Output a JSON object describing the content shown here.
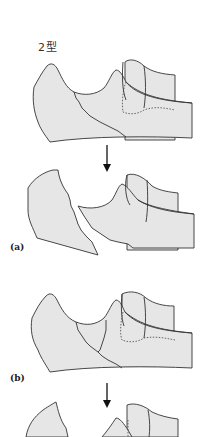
{
  "figure": {
    "title": "2型",
    "panels": [
      {
        "id": "a",
        "label": "(a)",
        "stages": [
          "fracture line (intact)",
          "displaced fragments"
        ]
      },
      {
        "id": "b",
        "label": "(b)",
        "stages": [
          "fracture line (intact)",
          "displaced fragments (cropped)"
        ]
      }
    ],
    "arrow_direction": "down",
    "colors": {
      "bone_fill": "#e6e6e6",
      "stroke": "#333333",
      "background": "#ffffff"
    }
  }
}
